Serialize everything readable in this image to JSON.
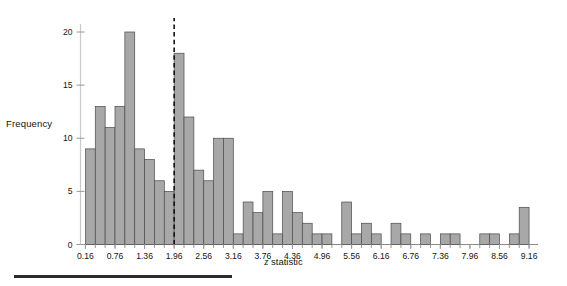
{
  "figure": {
    "ylabel": "Frequency",
    "xlabel_italic": "z",
    "xlabel_rest": " statistic"
  },
  "chart_data": {
    "type": "bar",
    "title": "",
    "xlabel": "z statistic",
    "ylabel": "Frequency",
    "xlim": [
      0.06,
      9.26
    ],
    "ylim": [
      0,
      21
    ],
    "bin_width": 0.2,
    "grid": false,
    "legend": null,
    "yticks": [
      0,
      5,
      10,
      15,
      20
    ],
    "ytick_labels": [
      "0",
      "5",
      "10",
      "15",
      "20"
    ],
    "xtick_labels": [
      "0.16",
      "0.76",
      "1.36",
      "1.96",
      "2.56",
      "3.16",
      "3.76",
      "4.36",
      "4.96",
      "5.56",
      "6.16",
      "6.76",
      "7.36",
      "7.96",
      "8.56",
      "9.16"
    ],
    "xtick_values": [
      0.16,
      0.76,
      1.36,
      1.96,
      2.56,
      3.16,
      3.76,
      4.36,
      4.96,
      5.56,
      6.16,
      6.76,
      7.36,
      7.96,
      8.56,
      9.16
    ],
    "annotations": [
      {
        "name": "significance-cutoff",
        "type": "vline",
        "x": 1.96,
        "style": "dashed",
        "color": "#111111"
      }
    ],
    "bin_left_edges": [
      0.16,
      0.36,
      0.56,
      0.76,
      0.96,
      1.16,
      1.36,
      1.56,
      1.76,
      1.96,
      2.16,
      2.36,
      2.56,
      2.76,
      2.96,
      3.16,
      3.36,
      3.56,
      3.76,
      3.96,
      4.16,
      4.36,
      4.56,
      4.76,
      4.96,
      5.16,
      5.36,
      5.56,
      5.76,
      5.96,
      6.16,
      6.36,
      6.56,
      6.76,
      6.96,
      7.16,
      7.36,
      7.56,
      7.76,
      7.96,
      8.16,
      8.36,
      8.56,
      8.76,
      8.96
    ],
    "values": [
      9,
      13,
      11,
      13,
      20,
      9,
      8,
      6,
      5,
      18,
      12,
      7,
      6,
      10,
      10,
      1,
      4,
      3,
      5,
      1,
      5,
      3,
      2,
      1,
      1,
      0,
      4,
      1,
      2,
      1,
      0,
      2,
      1,
      0,
      1,
      0,
      1,
      1,
      0,
      0,
      1,
      1,
      0,
      1,
      3.5
    ],
    "accent_color": "#a8a8a8",
    "bar_edge_color": "#4a4a4a"
  }
}
